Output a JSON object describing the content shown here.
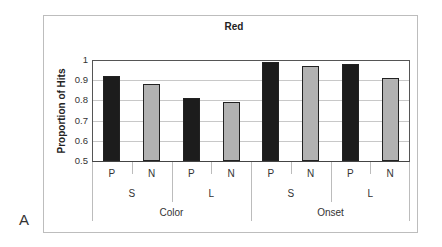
{
  "panel_label": "A",
  "chart_data": {
    "type": "bar",
    "title": "Red",
    "xlabel": "",
    "ylabel": "Proportion of Hits",
    "ylim": [
      0.5,
      1.0
    ],
    "yticks": [
      "0.5",
      "0.6",
      "0.7",
      "0.8",
      "0.9",
      "1"
    ],
    "grid": true,
    "legend": null,
    "x_hierarchy": {
      "level1": [
        "P",
        "N",
        "P",
        "N",
        "P",
        "N",
        "P",
        "N"
      ],
      "level2": [
        "S",
        "L",
        "S",
        "L"
      ],
      "level3": [
        "Color",
        "Onset"
      ]
    },
    "categories": [
      "Color-S-P",
      "Color-S-N",
      "Color-L-P",
      "Color-L-N",
      "Onset-S-P",
      "Onset-S-N",
      "Onset-L-P",
      "Onset-L-N"
    ],
    "values": [
      0.92,
      0.88,
      0.81,
      0.79,
      0.99,
      0.97,
      0.98,
      0.91
    ],
    "bar_colors": [
      "#1c1c1c",
      "#b2b2b2",
      "#1c1c1c",
      "#b2b2b2",
      "#1c1c1c",
      "#b2b2b2",
      "#1c1c1c",
      "#b2b2b2"
    ]
  }
}
